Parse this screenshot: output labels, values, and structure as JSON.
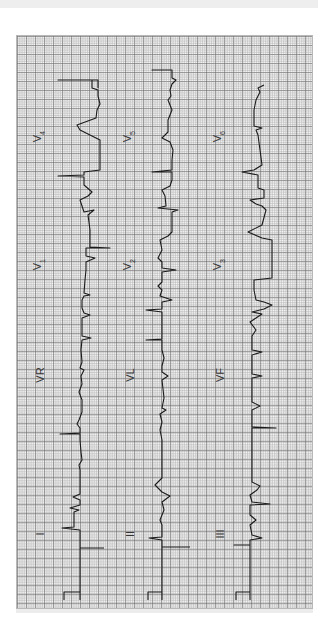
{
  "document": {
    "type": "12-lead ECG tracing (rotated 90°)",
    "orientation": "rotated counter-clockwise"
  },
  "colors": {
    "paper": "#f6f6f6",
    "grid_major": "#6e6e6e",
    "grid_minor": "#aaaaaa",
    "trace": "#1a1a1a",
    "label": "#333333"
  },
  "leads": {
    "row1": [
      {
        "label": "I"
      },
      {
        "label": "VR"
      },
      {
        "label": "V",
        "sub": "1"
      },
      {
        "label": "V",
        "sub": "4"
      }
    ],
    "row2": [
      {
        "label": "II"
      },
      {
        "label": "VL"
      },
      {
        "label": "V",
        "sub": "2"
      },
      {
        "label": "V",
        "sub": "5"
      }
    ],
    "row3": [
      {
        "label": "III"
      },
      {
        "label": "VF"
      },
      {
        "label": "V",
        "sub": "3"
      },
      {
        "label": "V",
        "sub": "6"
      }
    ]
  }
}
